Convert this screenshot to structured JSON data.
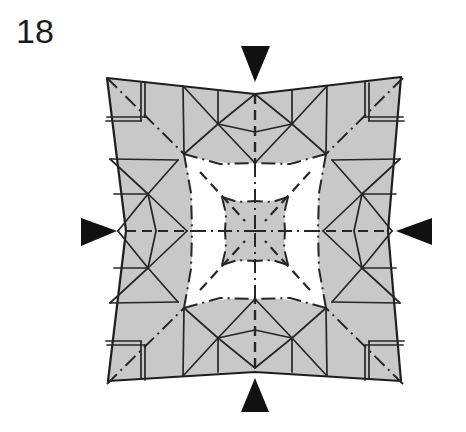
{
  "step": {
    "number": "18"
  },
  "diagram": {
    "center": [
      255,
      231
    ],
    "paper_outline": [
      [
        107,
        78
      ],
      [
        255,
        94
      ],
      [
        401,
        77
      ],
      [
        388,
        231
      ],
      [
        401,
        381
      ],
      [
        255,
        372
      ],
      [
        108,
        381
      ],
      [
        126,
        231
      ]
    ],
    "colors": {
      "paper": "#c8c8c8",
      "line": "#262626",
      "background": "#ffffff",
      "arrow": "#111111"
    },
    "push_arrows": [
      {
        "name": "push-arrow-top",
        "points": [
          [
            241,
            46
          ],
          [
            270,
            46
          ],
          [
            255,
            82
          ]
        ]
      },
      {
        "name": "push-arrow-bottom",
        "points": [
          [
            241,
            412
          ],
          [
            269,
            412
          ],
          [
            255,
            378
          ]
        ]
      },
      {
        "name": "push-arrow-left",
        "points": [
          [
            81,
            218
          ],
          [
            81,
            246
          ],
          [
            117,
            231
          ]
        ]
      },
      {
        "name": "push-arrow-right",
        "points": [
          [
            432,
            218
          ],
          [
            432,
            245
          ],
          [
            396,
            231
          ]
        ]
      }
    ],
    "line_legend": {
      "solid": "existing crease / edge",
      "dash-dot": "mountain fold",
      "dashed": "valley fold"
    }
  }
}
